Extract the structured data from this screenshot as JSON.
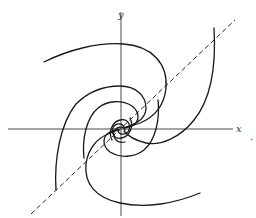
{
  "figure": {
    "type": "phase-portrait",
    "axes": {
      "x_label": "x",
      "y_label": "y"
    },
    "trailing_punctuation": ".",
    "colors": {
      "curves": "#1a1a1a",
      "axes": "#4a4a4a",
      "dashed_line": "#2a2a2a"
    }
  }
}
